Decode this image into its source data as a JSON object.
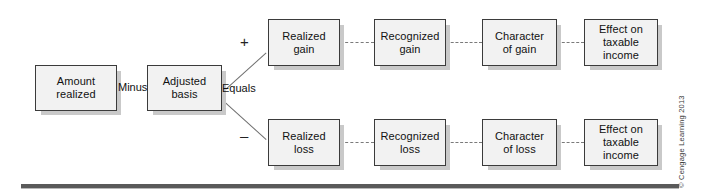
{
  "diagram": {
    "colors": {
      "box_fill": "#f2f2f2",
      "box_border": "#3b3b3b",
      "box_shadow": "#c9c9c9",
      "connector": "#7a7a7a",
      "rule": "#5a5a5a",
      "text": "#111111"
    },
    "nodes": {
      "amount_realized": {
        "line1": "Amount",
        "line2": "realized"
      },
      "adjusted_basis": {
        "line1": "Adjusted",
        "line2": "basis"
      },
      "realized_gain": {
        "line1": "Realized",
        "line2": "gain"
      },
      "recognized_gain": {
        "line1": "Recognized",
        "line2": "gain"
      },
      "character_of_gain": {
        "line1": "Character",
        "line2": "of gain"
      },
      "effect_taxable_income_gain": {
        "line1": "Effect on",
        "line2": "taxable",
        "line3": "income"
      },
      "realized_loss": {
        "line1": "Realized",
        "line2": "loss"
      },
      "recognized_loss": {
        "line1": "Recognized",
        "line2": "loss"
      },
      "character_of_loss": {
        "line1": "Character",
        "line2": "of loss"
      },
      "effect_taxable_income_loss": {
        "line1": "Effect on",
        "line2": "taxable",
        "line3": "income"
      }
    },
    "operators": {
      "minus": "Minus",
      "equals": "Equals",
      "plus_sign": "+",
      "minus_sign": "–"
    },
    "credit": "© Cengage Learning 2013"
  }
}
